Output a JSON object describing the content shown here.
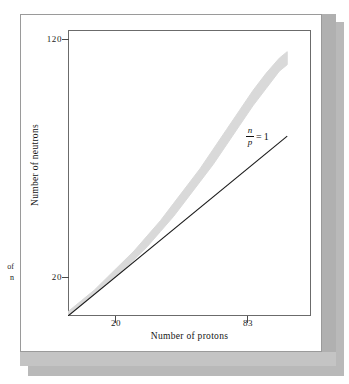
{
  "figure": {
    "caption_fragment_line1": "of",
    "caption_fragment_line2": "n"
  },
  "axes": {
    "x_title": "Number of protons",
    "y_title": "Number of neutrons",
    "x_ticks": [
      "20",
      "83"
    ],
    "y_ticks": [
      "120",
      "20"
    ]
  },
  "annotation": {
    "numerator": "n",
    "denominator": "p",
    "equals": "=",
    "value": "1"
  },
  "colors": {
    "band": "#d9d9d9",
    "line": "#1a1a1a",
    "frame": "#6b6b6b",
    "card_border": "#9a9a9a",
    "shadow": "#b9b9b9",
    "bevel_right": "#b0b0b0",
    "bevel_bottom": "#c4c4c4",
    "text": "#141414"
  },
  "chart_data": {
    "type": "scatter",
    "title": "",
    "subtitle": "",
    "xlabel": "Number of protons",
    "ylabel": "Number of neutrons",
    "xlim": [
      0,
      92
    ],
    "ylim": [
      0,
      132
    ],
    "xticks": [
      20,
      83
    ],
    "yticks": [
      20,
      120
    ],
    "grid": false,
    "legend": "none",
    "annotations": [
      {
        "text": "n/p = 1",
        "x": 83,
        "y": 96,
        "note": "label for the straight reference line of slope 1"
      }
    ],
    "series": [
      {
        "name": "n/p = 1 reference line",
        "type": "line",
        "x": [
          0,
          83
        ],
        "y": [
          0,
          83
        ]
      },
      {
        "name": "Belt of stability (band of stable nuclides)",
        "type": "area",
        "note": "Thick gray band; lower and upper edges of the band of stable nuclei",
        "x": [
          0,
          5,
          10,
          15,
          20,
          25,
          30,
          35,
          40,
          45,
          50,
          55,
          60,
          65,
          70,
          75,
          80,
          83
        ],
        "y_lower": [
          0,
          5,
          10,
          15,
          20,
          26,
          32,
          39,
          46,
          54,
          62,
          70,
          79,
          88,
          97,
          105,
          113,
          116
        ],
        "y_upper": [
          2,
          7,
          12,
          18,
          24,
          30,
          37,
          44,
          52,
          60,
          68,
          77,
          86,
          95,
          104,
          112,
          119,
          122
        ],
        "y_center": [
          1,
          6,
          11,
          16,
          22,
          28,
          34,
          41,
          49,
          57,
          65,
          74,
          83,
          92,
          100,
          108,
          116,
          119
        ]
      }
    ]
  }
}
